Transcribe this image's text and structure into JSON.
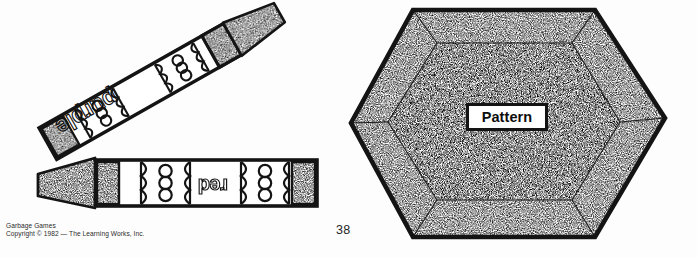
{
  "page": {
    "number": "38",
    "background_color": "#ffffff",
    "ink_color": "#111111"
  },
  "footer": {
    "title_line": "Garbage Games",
    "copyright_line": "Copyright © 1982 — The Learning Works, Inc."
  },
  "illustration": {
    "crayons": [
      {
        "id": "crayon-purple",
        "label": "purple",
        "label_style": "outline-bubble-letters",
        "orientation": "diagonal, tip pointing upper-right",
        "tip_fill": "stipple",
        "band_circles": 3
      },
      {
        "id": "crayon-red",
        "label": "red",
        "label_style": "outline-bubble-letters",
        "orientation": "horizontal, tip pointing left, text upside-down",
        "tip_fill": "stipple",
        "band_circles": 3
      }
    ],
    "hexagon": {
      "id": "pattern-hexagon",
      "fill": "stipple",
      "outline_color": "#111111",
      "has_inner_bevel": true,
      "label": "Pattern"
    }
  }
}
